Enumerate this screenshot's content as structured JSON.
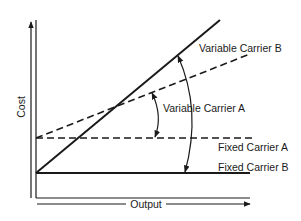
{
  "diagram": {
    "type": "cost-vs-output line diagram",
    "axes": {
      "y_label": "Cost",
      "x_label": "Output"
    },
    "lines": [
      {
        "id": "variable-carrier-b",
        "label": "Variable Carrier B",
        "style": "solid",
        "start": "Fixed Carrier B intercept",
        "slope": "steep"
      },
      {
        "id": "variable-carrier-a",
        "label": "Variable Carrier A",
        "style": "dashed",
        "start": "Fixed Carrier A intercept",
        "slope": "shallow"
      },
      {
        "id": "fixed-carrier-a",
        "label": "Fixed Carrier A",
        "style": "dashed",
        "level": "higher fixed cost"
      },
      {
        "id": "fixed-carrier-b",
        "label": "Fixed Carrier B",
        "style": "solid",
        "level": "lower fixed cost"
      }
    ],
    "annotations": [
      {
        "id": "angle-a",
        "type": "double-arrow arc",
        "between": [
          "Variable Carrier A",
          "Fixed Carrier A"
        ],
        "label": "Variable Carrier A"
      },
      {
        "id": "angle-b",
        "type": "double-arrow arc",
        "between": [
          "Variable Carrier B",
          "Fixed Carrier B"
        ],
        "label": "Variable Carrier B"
      }
    ],
    "colors": {
      "ink": "#1a1a1a",
      "background": "#ffffff"
    }
  },
  "labels": {
    "cost": "Cost",
    "output": "Output",
    "variable_carrier_b": "Variable Carrier B",
    "variable_carrier_a": "Variable Carrier A",
    "fixed_carrier_a": "Fixed Carrier A",
    "fixed_carrier_b": "Fixed Carrier B"
  }
}
